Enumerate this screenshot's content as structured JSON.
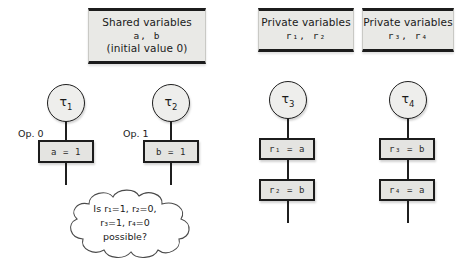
{
  "diagram": {
    "declarations": [
      {
        "name": "shared-variables",
        "line1": "Shared variables",
        "line2": "a,  b",
        "line3": "(initial value 0)"
      },
      {
        "name": "private-variables-1",
        "line1": "Private variables",
        "line2": "r₁, r₂",
        "line3": ""
      },
      {
        "name": "private-variables-2",
        "line1": "Private variables",
        "line2": "r₃, r₄",
        "line3": ""
      }
    ],
    "threads": [
      {
        "id": "thread-1",
        "label": "τ1",
        "tau": "τ",
        "index": "1",
        "op_label": "Op. 0",
        "operations": [
          "a = 1"
        ]
      },
      {
        "id": "thread-2",
        "label": "τ2",
        "tau": "τ",
        "index": "2",
        "op_label": "Op. 1",
        "operations": [
          "b = 1"
        ]
      },
      {
        "id": "thread-3",
        "label": "τ3",
        "tau": "τ",
        "index": "3",
        "op_label": "",
        "operations": [
          "r₁ = a",
          "r₂ = b"
        ]
      },
      {
        "id": "thread-4",
        "label": "τ4",
        "tau": "τ",
        "index": "4",
        "op_label": "",
        "operations": [
          "r₃ = b",
          "r₄ = a"
        ]
      }
    ],
    "question_cloud": {
      "line1": "Is r₁=1, r₂=0,",
      "line2": "r₃=1, r₄=0",
      "line3": "possible?"
    },
    "colors": {
      "box_fill": "#e9e9e6",
      "op_box_fill": "#e4e4e1",
      "stroke": "#1c1c1c",
      "background": "#ffffff"
    }
  }
}
